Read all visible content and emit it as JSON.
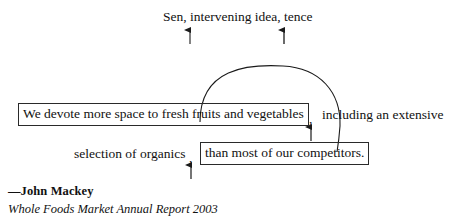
{
  "diagram": {
    "top_label": "Sen, intervening idea, tence",
    "main_clause_boxed": "We devote more space to fresh fruits and vegetables",
    "comma_after_main": ",",
    "main_clause_tail": "including an extensive",
    "second_line_lead": "selection of organics",
    "comma_second": ",",
    "second_clause_boxed": "than most of our competitors.",
    "ink_color": "#1a1a1a"
  },
  "arrows": {
    "top_left": "up-arrow-icon",
    "top_right": "up-arrow-icon",
    "main_comma": "up-arrow-icon",
    "second_comma": "up-arrow-icon"
  },
  "connector": {
    "name": "curved-connector-arc"
  },
  "attribution": {
    "name": "—John Mackey",
    "source": "Whole Foods Market Annual Report 2003"
  }
}
